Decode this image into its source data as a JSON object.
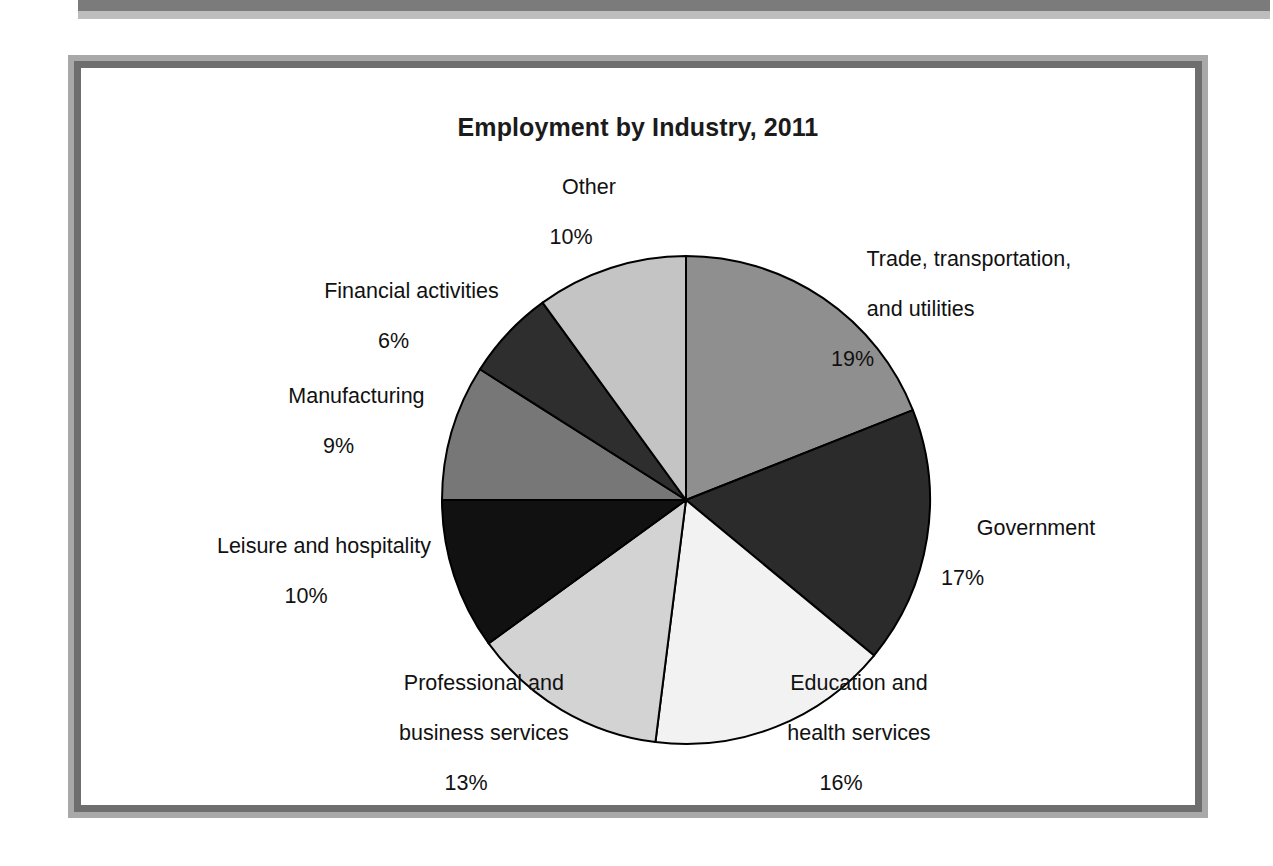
{
  "figure": {
    "title": "Employment by Industry, 2011"
  },
  "chart_data": {
    "type": "pie",
    "title": "Employment by Industry, 2011",
    "xlabel": "",
    "ylabel": "",
    "legend_position": "none",
    "grid": false,
    "unit": "percent",
    "start_angle_deg": 0,
    "direction": "clockwise",
    "categories": [
      "Trade, transportation, and utilities",
      "Government",
      "Education and health services",
      "Professional and business services",
      "Leisure and hospitality",
      "Manufacturing",
      "Financial activities",
      "Other"
    ],
    "values": [
      19,
      17,
      16,
      13,
      10,
      9,
      6,
      10
    ],
    "labels": [
      "19%",
      "17%",
      "16%",
      "13%",
      "10%",
      "9%",
      "6%",
      "10%"
    ],
    "colors": [
      "#8f8f8f",
      "#2b2b2b",
      "#f2f2f2",
      "#d3d3d3",
      "#111111",
      "#777777",
      "#2e2e2e",
      "#c4c4c4"
    ],
    "slice_border_color": "#000000"
  },
  "slices": {
    "trade": {
      "name": "Trade, transportation,",
      "name2": "and utilities",
      "pct": "19%"
    },
    "government": {
      "name": "Government",
      "pct": "17%"
    },
    "education": {
      "name": "Education and",
      "name2": "health services",
      "pct": "16%"
    },
    "professional": {
      "name": "Professional and",
      "name2": "business services",
      "pct": "13%"
    },
    "leisure": {
      "name": "Leisure and hospitality",
      "pct": "10%"
    },
    "manufacturing": {
      "name": "Manufacturing",
      "pct": "9%"
    },
    "financial": {
      "name": "Financial activities",
      "pct": "6%"
    },
    "other": {
      "name": "Other",
      "pct": "10%"
    }
  }
}
